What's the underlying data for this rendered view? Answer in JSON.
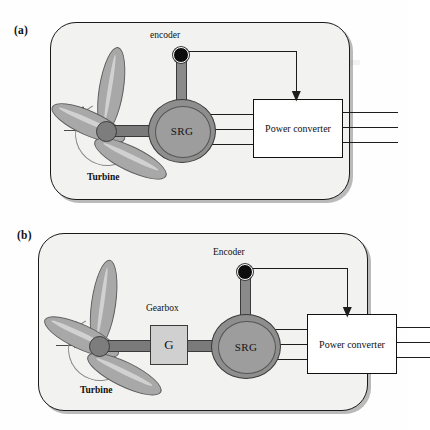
{
  "figure": {
    "panels": [
      {
        "id": "a",
        "label": "(a)",
        "turbine_label": "Turbine",
        "encoder_label": "encoder",
        "generator_label": "SRG",
        "converter_label": "Power converter",
        "has_gearbox": false,
        "gearbox_label": "",
        "gearbox_symbol": "",
        "phase_wire_count": 3,
        "output_line_count": 3
      },
      {
        "id": "b",
        "label": "(b)",
        "turbine_label": "Turbine",
        "encoder_label": "Encoder",
        "generator_label": "SRG",
        "converter_label": "Power converter",
        "has_gearbox": true,
        "gearbox_label": "Gearbox",
        "gearbox_symbol": "G",
        "phase_wire_count": 3,
        "output_line_count": 3
      }
    ]
  },
  "colors": {
    "panel_fill": "#f2f2f0",
    "panel_border": "#1a1a1a",
    "blade_fill": "#a8a8a8",
    "blade_edge": "#5e5e5e",
    "hub_fill": "#7d7d7d",
    "srg_fill": "#9d9d9d",
    "srg_ring": "#8e8e8e",
    "gearbox_fill": "#d0d0d0",
    "shaft_fill": "#7a7a7a",
    "encoder_dot": "#0d0d0d",
    "converter_fill": "#ffffff",
    "wire": "#1d1d1d",
    "page_background": "#fefefe"
  }
}
